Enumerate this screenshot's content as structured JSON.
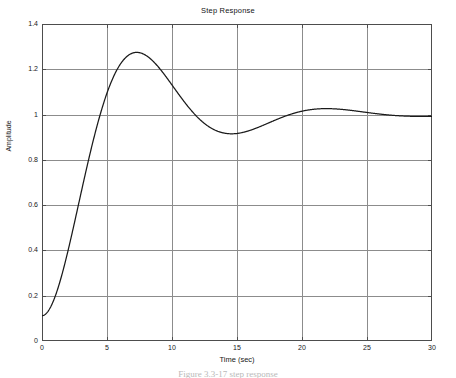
{
  "figure": {
    "caption": "Figure 3.3-17  step response"
  },
  "chart_data": {
    "type": "line",
    "title": "Step Response",
    "xlabel": "Time (sec)",
    "ylabel": "Amplitude",
    "xlim": [
      0,
      30
    ],
    "ylim": [
      0,
      1.4
    ],
    "grid": true,
    "legend": false,
    "line_color": "#1a1a1a",
    "grid_color": "#8c8c8c",
    "axis_color": "#4d4d4d",
    "background_color": "#ffffff",
    "xticks": [
      0,
      5,
      10,
      15,
      20,
      25,
      30
    ],
    "xtick_labels": [
      "0",
      "5",
      "10",
      "15",
      "20",
      "25",
      "30"
    ],
    "yticks": [
      0,
      0.2,
      0.4,
      0.6,
      0.8,
      1,
      1.2,
      1.4
    ],
    "ytick_labels": [
      "0",
      "0.2",
      "0.4",
      "0.6",
      "0.8",
      "1",
      "1.2",
      "1.4"
    ],
    "annotations": {
      "peak_value": 1.27,
      "peak_time": 6.9,
      "steady_state": 1.0,
      "damping_ratio": 0.35,
      "natural_frequency": 0.46
    },
    "series": [
      {
        "name": "Step Response",
        "x": [
          0,
          0.5,
          1,
          1.5,
          2,
          2.5,
          3,
          3.5,
          4,
          4.5,
          5,
          5.5,
          6,
          6.5,
          7,
          7.5,
          8,
          8.5,
          9,
          9.5,
          10,
          10.5,
          11,
          11.5,
          12,
          12.5,
          13,
          13.5,
          14,
          14.5,
          15,
          15.5,
          16,
          16.5,
          17,
          17.5,
          18,
          18.5,
          19,
          19.5,
          20,
          21,
          22,
          23,
          24,
          25,
          26,
          27,
          28,
          29,
          30
        ],
        "y": [
          0,
          0.024,
          0.09,
          0.192,
          0.318,
          0.458,
          0.6,
          0.735,
          0.855,
          0.956,
          1.036,
          1.095,
          1.134,
          1.157,
          1.166,
          1.164,
          1.155,
          1.14,
          1.121,
          1.101,
          1.08,
          1.06,
          1.042,
          1.026,
          1.012,
          1.0,
          0.991,
          0.984,
          0.979,
          0.975,
          0.973,
          0.972,
          0.973,
          0.974,
          0.976,
          0.978,
          0.981,
          0.984,
          0.986,
          0.989,
          0.991,
          0.996,
          1.0,
          1.002,
          1.003,
          1.003,
          1.002,
          1.001,
          1.0,
          1.0,
          1.0
        ]
      }
    ]
  }
}
